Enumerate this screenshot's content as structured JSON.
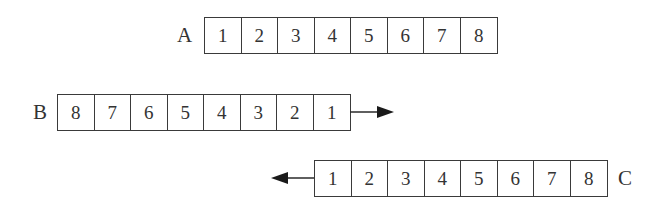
{
  "rows": [
    {
      "label": "A",
      "cells": [
        "1",
        "2",
        "3",
        "4",
        "5",
        "6",
        "7",
        "8"
      ],
      "arrow": "none"
    },
    {
      "label": "B",
      "cells": [
        "8",
        "7",
        "6",
        "5",
        "4",
        "3",
        "2",
        "1"
      ],
      "arrow": "right"
    },
    {
      "label": "C",
      "cells": [
        "1",
        "2",
        "3",
        "4",
        "5",
        "6",
        "7",
        "8"
      ],
      "arrow": "left"
    }
  ],
  "colors": {
    "line": "#3a3a3a",
    "text": "#333333",
    "background": "#ffffff"
  }
}
